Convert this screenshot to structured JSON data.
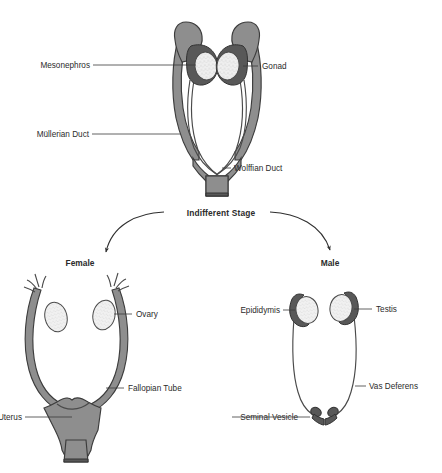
{
  "figure": {
    "title_visible": false,
    "background_color": "#ffffff"
  },
  "palette": {
    "organ_gray": "#8e8e8e",
    "organ_dark_gray": "#585858",
    "gonad_pale": "#efefef",
    "outline": "#3c3c3c",
    "text": "#2b2b2b"
  },
  "stage_label": {
    "text": "Indifferent Stage",
    "bold": true
  },
  "branches": [
    {
      "key": "female",
      "label": "Female"
    },
    {
      "key": "male",
      "label": "Male"
    }
  ],
  "panels": {
    "indifferent": {
      "labels": [
        {
          "key": "mesonephros",
          "text": "Mesonephros",
          "side": "left"
        },
        {
          "key": "gonad",
          "text": "Gonad",
          "side": "right"
        },
        {
          "key": "mullerian_duct",
          "text": "Müllerian Duct",
          "side": "left"
        },
        {
          "key": "wolffian_duct",
          "text": "Wolffian Duct",
          "side": "right"
        }
      ]
    },
    "female": {
      "heading": "Female",
      "labels": [
        {
          "key": "ovary",
          "text": "Ovary",
          "side": "right"
        },
        {
          "key": "fallopian_tube",
          "text": "Fallopian Tube",
          "side": "right"
        },
        {
          "key": "uterus",
          "text": "Uterus",
          "side": "left"
        }
      ]
    },
    "male": {
      "heading": "Male",
      "labels": [
        {
          "key": "epididymis",
          "text": "Epididymis",
          "side": "left"
        },
        {
          "key": "testis",
          "text": "Testis",
          "side": "right"
        },
        {
          "key": "vas_deferens",
          "text": "Vas Deferens",
          "side": "right"
        },
        {
          "key": "seminal_vesicle",
          "text": "Seminal Vesicle",
          "side": "left"
        }
      ]
    }
  }
}
